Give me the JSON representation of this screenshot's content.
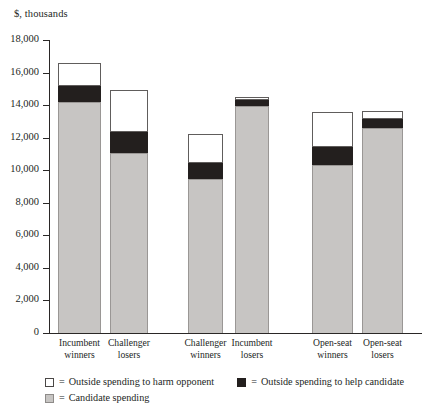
{
  "chart_data": {
    "type": "bar",
    "stacked": true,
    "title": "$, thousands",
    "xlabel": "",
    "ylabel": "$, thousands",
    "ylim": [
      0,
      18000
    ],
    "ytick_step": 2000,
    "grid": false,
    "legend_position": "bottom-left",
    "categories": [
      "Incumbent winners",
      "Challenger losers",
      "Challenger winners",
      "Incumbent losers",
      "Open-seat winners",
      "Open-seat losers"
    ],
    "category_lines": [
      [
        "Incumbent",
        "winners"
      ],
      [
        "Challenger",
        "losers"
      ],
      [
        "Challenger",
        "winners"
      ],
      [
        "Incumbent",
        "losers"
      ],
      [
        "Open-seat",
        "winners"
      ],
      [
        "Open-seat",
        "losers"
      ]
    ],
    "series": [
      {
        "name": "Candidate spending",
        "key": "candidate",
        "color": "#c7c5c3",
        "values": [
          14200,
          11050,
          9450,
          13950,
          10300,
          12600
        ]
      },
      {
        "name": "Outside spending to help candidate",
        "key": "help",
        "color": "#231f1e",
        "values": [
          950,
          1300,
          1000,
          350,
          1100,
          550
        ]
      },
      {
        "name": "Outside spending to harm opponent",
        "key": "harm",
        "color": "#ffffff",
        "values": [
          1450,
          2550,
          1800,
          200,
          2200,
          500
        ]
      }
    ],
    "totals": [
      16600,
      14900,
      12250,
      14500,
      13600,
      13650
    ],
    "ytick_labels": [
      "18,000",
      "16,000",
      "14,000",
      "12,000",
      "10,000",
      "8,000",
      "6,000",
      "4,000",
      "2,000",
      "0"
    ],
    "ytick_values": [
      18000,
      16000,
      14000,
      12000,
      10000,
      8000,
      6000,
      4000,
      2000,
      0
    ]
  },
  "legend": {
    "rows": [
      [
        {
          "swatch": "white",
          "eq": "=",
          "label": "Outside spending to harm opponent"
        },
        {
          "swatch": "black",
          "eq": "=",
          "label": "Outside spending to help candidate"
        }
      ],
      [
        {
          "swatch": "gray",
          "eq": "=",
          "label": "Candidate spending"
        }
      ]
    ]
  }
}
